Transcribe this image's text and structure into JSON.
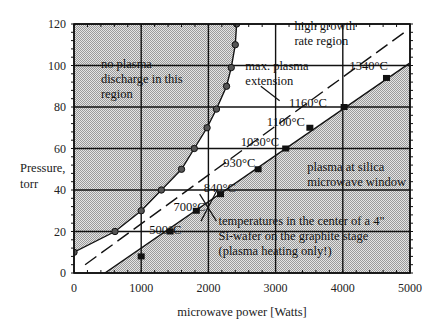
{
  "chart_data": {
    "type": "scatter",
    "title": "",
    "xlabel": "microwave power [Watts]",
    "ylabel": "Pressure, torr",
    "ylabel_lines": [
      "Pressure,",
      "torr"
    ],
    "xlim": [
      0,
      5000
    ],
    "ylim": [
      0,
      120
    ],
    "x_ticks": [
      0,
      1000,
      2000,
      3000,
      4000,
      5000
    ],
    "y_ticks": [
      0,
      20,
      40,
      60,
      80,
      100,
      120
    ],
    "grid": true,
    "legend": null,
    "series": [
      {
        "name": "plasma ignition boundary (circles)",
        "marker": "circle",
        "line": "solid",
        "points": [
          [
            0,
            10
          ],
          [
            610,
            20
          ],
          [
            1000,
            30
          ],
          [
            1300,
            40
          ],
          [
            1600,
            50
          ],
          [
            1790,
            60
          ],
          [
            1980,
            70
          ],
          [
            2120,
            79
          ],
          [
            2270,
            90
          ],
          [
            2340,
            99
          ],
          [
            2400,
            110
          ],
          [
            2420,
            120
          ]
        ]
      },
      {
        "name": "wafer temperature points (squares)",
        "marker": "square",
        "line": "none",
        "points": [
          [
            1000,
            8
          ],
          [
            1430,
            20
          ],
          [
            1820,
            30
          ],
          [
            2180,
            38
          ],
          [
            2740,
            50
          ],
          [
            3150,
            60
          ],
          [
            3510,
            70
          ],
          [
            4020,
            80
          ],
          [
            4650,
            94
          ]
        ]
      },
      {
        "name": "plasma at silica window boundary",
        "marker": "none",
        "line": "solid",
        "points": [
          [
            460,
            0
          ],
          [
            4990,
            101
          ]
        ]
      },
      {
        "name": "max. plasma extension",
        "marker": "none",
        "line": "dashed",
        "points": [
          [
            165,
            4
          ],
          [
            4960,
            117
          ]
        ]
      }
    ],
    "temperature_labels": [
      {
        "text": "500°C",
        "x": 1120,
        "y": 19
      },
      {
        "text": "700°C",
        "x": 1480,
        "y": 30
      },
      {
        "text": "840°C",
        "x": 1930,
        "y": 39
      },
      {
        "text": "930°C",
        "x": 2220,
        "y": 51
      },
      {
        "text": "1030°C",
        "x": 2480,
        "y": 61
      },
      {
        "text": "1100°C",
        "x": 2870,
        "y": 71
      },
      {
        "text": "1160°C",
        "x": 3200,
        "y": 80
      },
      {
        "text": "1340°C",
        "x": 4100,
        "y": 98
      }
    ],
    "region_labels": [
      {
        "lines": [
          "no plasma",
          "discharge in this",
          "region"
        ],
        "x": 400,
        "y": 99
      },
      {
        "lines": [
          "high growth",
          "rate region"
        ],
        "x": 3280,
        "y": 117
      },
      {
        "lines": [
          "max. plasma",
          "extension"
        ],
        "x": 2550,
        "y": 98
      },
      {
        "lines": [
          "plasma at silica",
          "microwave window"
        ],
        "x": 3470,
        "y": 49
      },
      {
        "lines": [
          "temperatures in the center of a 4\"",
          "Si-wafer on the graphite stage",
          "(plasma heating only!)"
        ],
        "x": 2150,
        "y": 23
      }
    ],
    "colors": {
      "shaded_region": "#c8c8c8",
      "line": "#111111",
      "grid": "#111111",
      "background": "#ffffff"
    }
  }
}
